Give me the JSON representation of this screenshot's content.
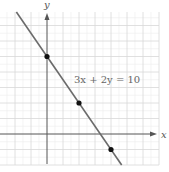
{
  "chart_data": {
    "type": "line",
    "title": "",
    "equation_label": "3x + 2y = 10",
    "xlabel": "x",
    "ylabel": "y",
    "xlim": [
      -3,
      7
    ],
    "ylim": [
      -2,
      8
    ],
    "grid": true,
    "grid_minor": true,
    "series": [
      {
        "name": "3x + 2y = 10",
        "slope": -1.5,
        "intercept": 5,
        "color": "#6b6b6b"
      }
    ],
    "points": [
      {
        "x": 0,
        "y": 5
      },
      {
        "x": 2,
        "y": 2
      },
      {
        "x": 4,
        "y": -1
      }
    ]
  },
  "colors": {
    "grid_major": "#d8d8d8",
    "grid_minor": "#ececec",
    "axis": "#555555",
    "line": "#6b6b6b",
    "point": "#111111"
  }
}
